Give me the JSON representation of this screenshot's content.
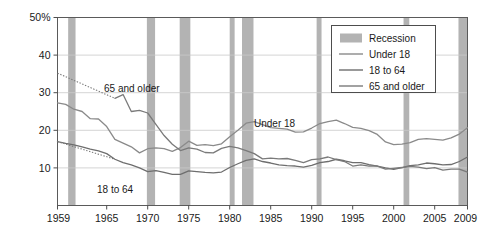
{
  "chart_data": {
    "type": "line",
    "title": "",
    "subtitle": "",
    "xlabel": "",
    "ylabel": "",
    "xlim": [
      1959,
      2009
    ],
    "ylim": [
      0,
      50
    ],
    "grid": true,
    "grid_axis": "y",
    "legend_position": "top-right",
    "x_tick_labels": [
      "1959",
      "1965",
      "1970",
      "1975",
      "1980",
      "1985",
      "1990",
      "1995",
      "2000",
      "2005",
      "2009"
    ],
    "x_ticks": [
      1959,
      1965,
      1970,
      1975,
      1980,
      1985,
      1990,
      1995,
      2000,
      2005,
      2009
    ],
    "y_tick_labels": [
      "10",
      "20",
      "30",
      "40",
      "50%"
    ],
    "y_ticks": [
      10,
      20,
      30,
      40,
      50
    ],
    "x": [
      1959,
      1960,
      1961,
      1962,
      1963,
      1964,
      1965,
      1966,
      1967,
      1968,
      1969,
      1970,
      1971,
      1972,
      1973,
      1974,
      1975,
      1976,
      1977,
      1978,
      1979,
      1980,
      1981,
      1982,
      1983,
      1984,
      1985,
      1986,
      1987,
      1988,
      1989,
      1990,
      1991,
      1992,
      1993,
      1994,
      1995,
      1996,
      1997,
      1998,
      1999,
      2000,
      2001,
      2002,
      2003,
      2004,
      2005,
      2006,
      2007,
      2008,
      2009
    ],
    "series": [
      {
        "name": "Under 18",
        "color": "#8a8a8a",
        "style": "solid",
        "values": [
          27.3,
          26.9,
          25.6,
          25.0,
          23.1,
          23.0,
          21.0,
          17.6,
          16.6,
          15.6,
          14.0,
          15.1,
          15.3,
          15.1,
          14.4,
          15.4,
          17.1,
          16.0,
          16.2,
          15.9,
          16.4,
          18.3,
          20.0,
          21.9,
          22.3,
          21.5,
          20.7,
          20.5,
          20.3,
          19.5,
          19.6,
          20.6,
          21.8,
          22.3,
          22.7,
          21.8,
          20.8,
          20.5,
          19.9,
          18.9,
          16.9,
          16.2,
          16.3,
          16.7,
          17.6,
          17.8,
          17.6,
          17.4,
          18.0,
          19.0,
          20.7
        ],
        "dotted_prefix": false
      },
      {
        "name": "18 to 64",
        "color": "#6e6e6e",
        "style": "solid",
        "values": [
          17.0,
          16.5,
          16.1,
          15.6,
          15.0,
          14.5,
          13.8,
          12.3,
          11.4,
          10.8,
          10.0,
          9.0,
          9.3,
          8.8,
          8.3,
          8.3,
          9.2,
          9.0,
          8.8,
          8.7,
          8.9,
          10.1,
          11.1,
          12.0,
          12.4,
          11.7,
          11.3,
          10.8,
          10.6,
          10.5,
          10.2,
          10.7,
          11.4,
          11.7,
          12.3,
          11.9,
          11.4,
          11.4,
          10.9,
          10.5,
          10.0,
          9.6,
          10.1,
          10.6,
          10.8,
          11.3,
          11.1,
          10.8,
          10.9,
          11.7,
          12.9
        ],
        "dotted_prefix": false
      },
      {
        "name": "65 and older",
        "color": "#7a7a7a",
        "style": "solid",
        "values": [
          35.2,
          34.2,
          33.0,
          31.8,
          30.7,
          29.6,
          28.5,
          28.5,
          29.5,
          25.0,
          25.3,
          24.6,
          21.6,
          18.6,
          16.3,
          14.6,
          15.3,
          15.0,
          14.1,
          14.0,
          15.2,
          15.7,
          15.3,
          14.6,
          13.8,
          12.4,
          12.6,
          12.4,
          12.5,
          12.0,
          11.4,
          12.2,
          12.4,
          12.9,
          12.2,
          11.7,
          10.5,
          10.8,
          10.5,
          10.5,
          9.7,
          9.9,
          10.1,
          10.4,
          10.2,
          9.8,
          10.1,
          9.4,
          9.7,
          9.7,
          8.9
        ],
        "dotted_prefix": true,
        "dotted_through_year": 1965
      }
    ],
    "dotted_note": "Early-period values for 65 and older and 18 to 64 are shown as dotted interpolation before 1966",
    "dotted_segments": [
      {
        "series": "65 and older",
        "from_year": 1959,
        "to_year": 1966,
        "from_value": 35.2,
        "to_value": 28.5
      },
      {
        "series": "18 to 64",
        "from_year": 1959,
        "to_year": 1966,
        "from_value": 17.0,
        "to_value": 12.3
      }
    ],
    "recessions": [
      {
        "start": 1960.3,
        "end": 1961.2
      },
      {
        "start": 1969.9,
        "end": 1970.9
      },
      {
        "start": 1973.9,
        "end": 1975.2
      },
      {
        "start": 1980.0,
        "end": 1980.6
      },
      {
        "start": 1981.5,
        "end": 1982.9
      },
      {
        "start": 1990.6,
        "end": 1991.2
      },
      {
        "start": 2001.2,
        "end": 2001.9
      },
      {
        "start": 2007.9,
        "end": 2009.4
      }
    ],
    "recession_color": "#b3b3b3",
    "annotations": [
      {
        "name": "65 and older",
        "text": "65 and older",
        "x_px": 104,
        "y_px": 92
      },
      {
        "name": "18 to 64",
        "text": "18 to 64",
        "x_px": 97,
        "y_px": 193
      },
      {
        "name": "Under 18",
        "text": "Under 18",
        "x_px": 254,
        "y_px": 127
      }
    ]
  },
  "legend": {
    "name": "chart-legend",
    "items": [
      {
        "label": "Recession",
        "marker": "swatch",
        "color": "#b3b3b3"
      },
      {
        "label": "Under 18",
        "marker": "line",
        "color": "#8a8a8a"
      },
      {
        "label": "18 to 64",
        "marker": "line",
        "color": "#6e6e6e"
      },
      {
        "label": "65 and older",
        "marker": "line",
        "color": "#7a7a7a"
      }
    ]
  },
  "axes": {
    "y_axis_top_label": "50%",
    "x_axis_first_label": "1959",
    "x_axis_last_label": "2009"
  },
  "colors": {
    "axis": "#4d4d4d",
    "grid": "#c9c9c9",
    "recession": "#b3b3b3",
    "background": "#ffffff",
    "text": "#1a1a1a"
  }
}
